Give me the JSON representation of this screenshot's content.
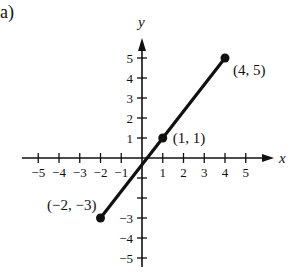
{
  "part_label": "(a)",
  "chart_data": {
    "type": "line",
    "title": "",
    "xlabel": "x",
    "ylabel": "y",
    "xlim": [
      -5.5,
      6.3
    ],
    "ylim": [
      -5.5,
      5.9
    ],
    "x_ticks": [
      -5,
      -4,
      -3,
      -2,
      -1,
      1,
      2,
      3,
      4,
      5
    ],
    "x_tick_labels": [
      "−5",
      "−4",
      "−3",
      "−2",
      "−1",
      "1",
      "2",
      "3",
      "4",
      "5"
    ],
    "y_ticks": [
      -5,
      -4,
      -3,
      -2,
      -1,
      1,
      2,
      3,
      4,
      5
    ],
    "y_tick_labels": [
      "−5",
      "−4",
      "−3",
      "",
      "",
      "1",
      "2",
      "3",
      "4",
      "5"
    ],
    "grid": false,
    "series": [
      {
        "name": "segment",
        "x": [
          -2,
          4
        ],
        "y": [
          -3,
          5
        ],
        "color": "#111111"
      }
    ],
    "points": [
      {
        "x": -2,
        "y": -3,
        "label": "(−2, −3)",
        "label_pos": "left"
      },
      {
        "x": 1,
        "y": 1,
        "label": "(1, 1)",
        "label_pos": "right"
      },
      {
        "x": 4,
        "y": 5,
        "label": "(4, 5)",
        "label_pos": "below-right"
      }
    ]
  }
}
